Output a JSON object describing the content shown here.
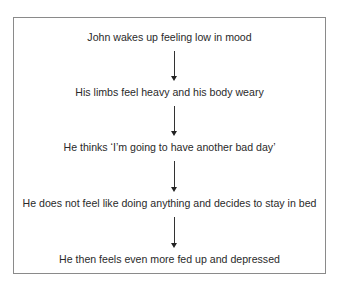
{
  "diagram": {
    "type": "flowchart",
    "steps": [
      {
        "label": "John wakes up feeling low in mood"
      },
      {
        "label": "His limbs feel heavy and his body weary"
      },
      {
        "label": "He thinks ‘I’m going to have another bad day’"
      },
      {
        "label": "He does not feel like doing anything and decides to stay in bed"
      },
      {
        "label": "He then feels even more fed up and depressed"
      }
    ],
    "connectors": [
      {
        "from": 0,
        "to": 1
      },
      {
        "from": 1,
        "to": 2
      },
      {
        "from": 2,
        "to": 3
      },
      {
        "from": 3,
        "to": 4
      }
    ]
  }
}
